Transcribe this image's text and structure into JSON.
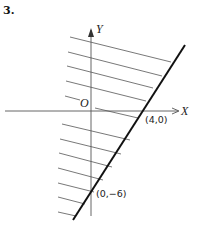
{
  "problem_number": "3.",
  "axes": {
    "x_label": "X",
    "y_label": "Y",
    "origin_label": "O"
  },
  "points": [
    {
      "label": "(4,0)",
      "x": 4,
      "y": 0
    },
    {
      "label": "(0,−6)",
      "x": 0,
      "y": -6
    }
  ],
  "boundary_line": {
    "description": "line through (4,0) and (0,-6)",
    "equation": "3x - 2y = 12"
  },
  "shaded_region": "side of the line containing the origin (upper-left), shown with parallel hatch lines",
  "colors": {
    "line": "#111111",
    "hatch": "#555555",
    "background": "#ffffff"
  }
}
